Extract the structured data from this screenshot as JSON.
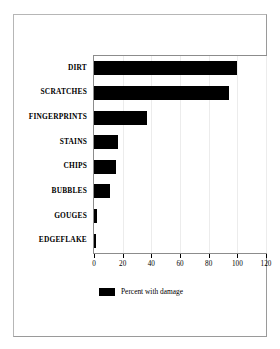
{
  "chart_data": {
    "type": "bar",
    "orientation": "horizontal",
    "title": "",
    "xlabel": "",
    "ylabel": "",
    "categories": [
      "DIRT",
      "SCRATCHES",
      "FINGERPRINTS",
      "STAINS",
      "CHIPS",
      "BUBBLES",
      "GOUGES",
      "EDGEFLAKE"
    ],
    "values": [
      100,
      94,
      37,
      17,
      15,
      11,
      2,
      1
    ],
    "series": [
      {
        "name": "Percent with damage",
        "values": [
          100,
          94,
          37,
          17,
          15,
          11,
          2,
          1
        ],
        "color": "#000000"
      }
    ],
    "xlim": [
      0,
      120
    ],
    "xticks": [
      0,
      20,
      40,
      60,
      80,
      100,
      120
    ],
    "xtick_labels": [
      "0",
      "20",
      "40",
      "60",
      "80",
      "100",
      "120"
    ],
    "grid": true,
    "grid_axis": "x",
    "legend": {
      "position": "bottom-center",
      "entries": [
        {
          "label": "Percent with damage",
          "color": "#000000"
        }
      ]
    }
  },
  "figure": {
    "frame_color": "#b6b6b6",
    "background": "#ffffff",
    "plot_border_color": "#8c8c8c",
    "gridline_color": "#ececec",
    "bar_color": "#000000"
  }
}
